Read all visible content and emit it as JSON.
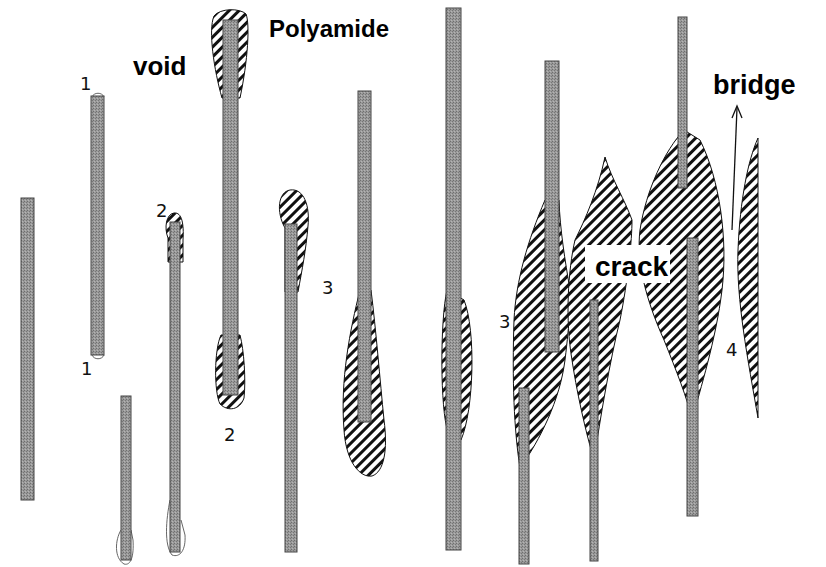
{
  "labels": {
    "void": "void",
    "polyamide": "Polyamide",
    "bridge": "bridge",
    "crack": "crack"
  },
  "stage_markers": {
    "one_top": "1",
    "one_bottom": "1",
    "two_top": "2",
    "two_bottom": "2",
    "three_left": "3",
    "three_right": "3",
    "four": "4"
  },
  "legend_semantics": {
    "fiber_fill": "grey stippled bar = fiber",
    "matrix_fill": "diagonal hatch = polyamide matrix",
    "void_fill": "white outline = void"
  },
  "colors": {
    "fiber": "#8c8c8c",
    "fiber_edge": "#444444",
    "hatch_line": "#111111",
    "background": "#ffffff"
  }
}
